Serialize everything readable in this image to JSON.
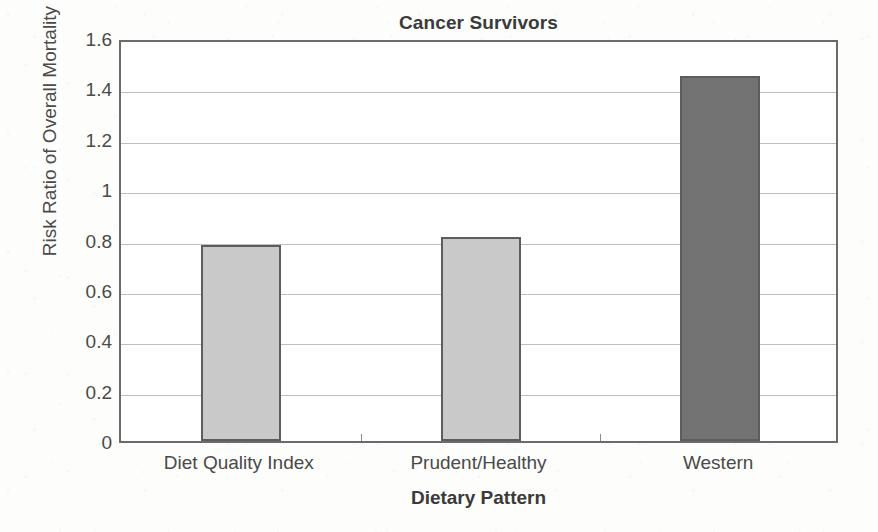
{
  "chart_data": {
    "type": "bar",
    "title": "Cancer Survivors",
    "xlabel": "Dietary Pattern",
    "ylabel": "Risk Ratio of Overall Mortality",
    "categories": [
      "Diet Quality Index",
      "Prudent/Healthy",
      "Western"
    ],
    "values": [
      0.78,
      0.81,
      1.45
    ],
    "series": [
      {
        "name": "Risk Ratio of Overall Mortality",
        "values": [
          0.78,
          0.81,
          1.45
        ]
      }
    ],
    "ylim": [
      0,
      1.6
    ],
    "ytick_labels": [
      "0",
      "0.2",
      "0.4",
      "0.6",
      "0.8",
      "1",
      "1.2",
      "1.4",
      "1.6"
    ],
    "ytick_values": [
      0,
      0.2,
      0.4,
      0.6,
      0.8,
      1.0,
      1.2,
      1.4,
      1.6
    ],
    "grid": true,
    "legend": "none",
    "bar_colors": [
      "#c9c9c9",
      "#c9c9c9",
      "#737373"
    ],
    "bar_edge_color": "#5d5d5d",
    "grid_color": "#bdbdbd",
    "axis_color": "#6b6b6b",
    "text_color": "#4a4a4a",
    "background_color": "#fdfdfc",
    "plot_background_color": "#ffffff"
  }
}
